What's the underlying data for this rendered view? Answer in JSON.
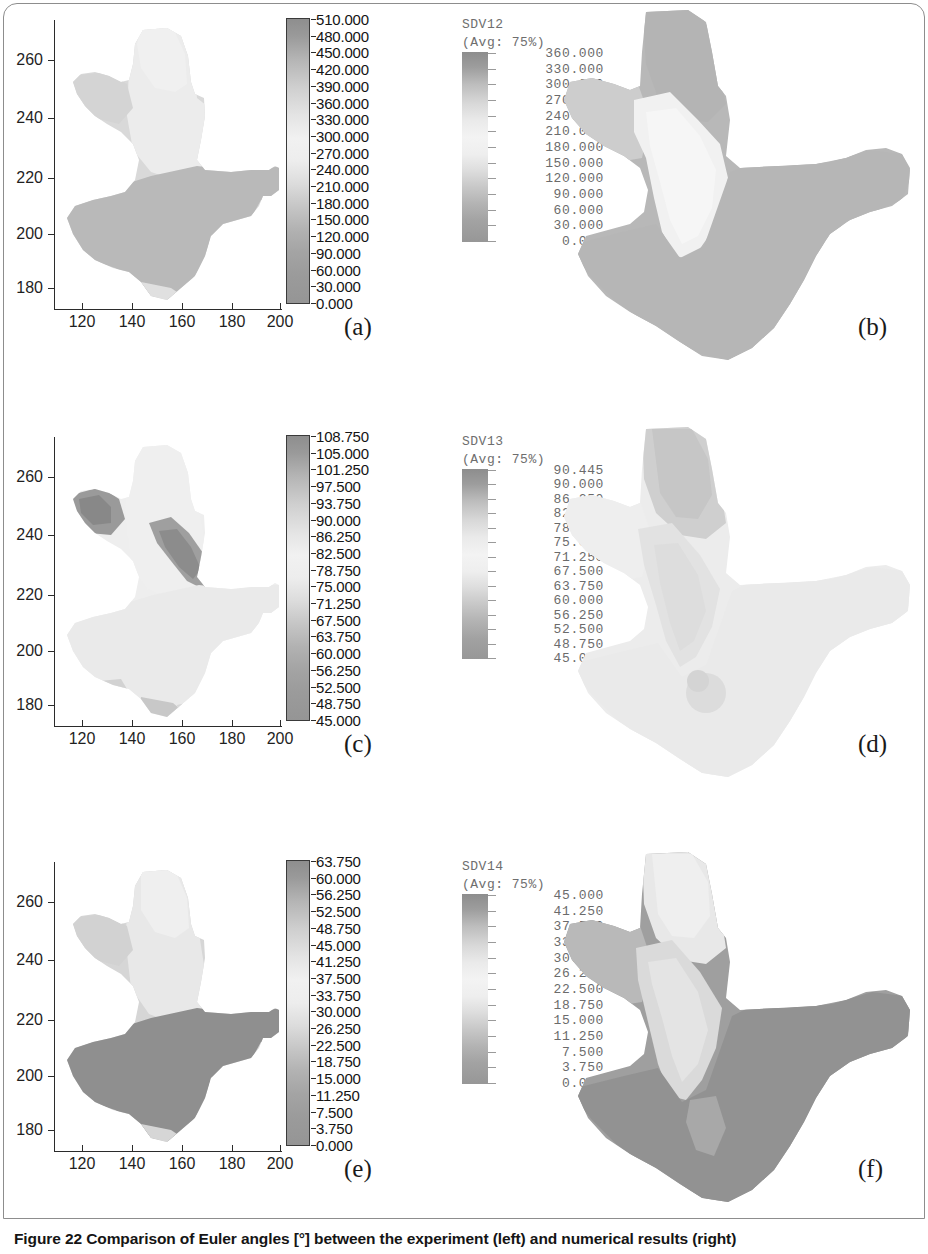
{
  "figure": {
    "caption": "Figure 22 Comparison of Euler angles [°] between the experiment (left) and numerical results (right)",
    "caption_label": "Figure 22",
    "left_column_title": "experiment",
    "right_column_title": "numerical results"
  },
  "axes": {
    "x_ticks": [
      "120",
      "140",
      "160",
      "180",
      "200"
    ],
    "y_ticks": [
      "180",
      "200",
      "220",
      "240",
      "260"
    ],
    "x_range": [
      110,
      203
    ],
    "y_range": [
      171,
      268
    ]
  },
  "panels": [
    {
      "letter": "(a)",
      "kind": "experiment",
      "colorbar": {
        "labels": [
          "510.000",
          "480.000",
          "450.000",
          "420.000",
          "390.000",
          "360.000",
          "330.000",
          "300.000",
          "270.000",
          "240.000",
          "210.000",
          "180.000",
          "150.000",
          "120.000",
          "90.000",
          "60.000",
          "30.000",
          "0.000"
        ],
        "max": 510.0,
        "min": 0.0,
        "step": 30.0
      }
    },
    {
      "letter": "(b)",
      "kind": "numerical",
      "legend_var": "SDV12",
      "legend_avg": "(Avg: 75%)",
      "colorbar": {
        "labels": [
          "360.000",
          "330.000",
          "300.000",
          "270.000",
          "240.000",
          "210.000",
          "180.000",
          "150.000",
          "120.000",
          "90.000",
          "60.000",
          "30.000",
          "0.000"
        ],
        "max": 360.0,
        "min": 0.0,
        "step": 30.0
      }
    },
    {
      "letter": "(c)",
      "kind": "experiment",
      "colorbar": {
        "labels": [
          "108.750",
          "105.000",
          "101.250",
          "97.500",
          "93.750",
          "90.000",
          "86.250",
          "82.500",
          "78.750",
          "75.000",
          "71.250",
          "67.500",
          "63.750",
          "60.000",
          "56.250",
          "52.500",
          "48.750",
          "45.000"
        ],
        "max": 108.75,
        "min": 45.0,
        "step": 3.75
      }
    },
    {
      "letter": "(d)",
      "kind": "numerical",
      "legend_var": "SDV13",
      "legend_avg": "(Avg: 75%)",
      "colorbar": {
        "labels": [
          "90.445",
          "90.000",
          "86.250",
          "82.500",
          "78.750",
          "75.000",
          "71.250",
          "67.500",
          "63.750",
          "60.000",
          "56.250",
          "52.500",
          "48.750",
          "45.000"
        ],
        "max": 90.445,
        "min": 45.0,
        "step": 3.75
      }
    },
    {
      "letter": "(e)",
      "kind": "experiment",
      "colorbar": {
        "labels": [
          "63.750",
          "60.000",
          "56.250",
          "52.500",
          "48.750",
          "45.000",
          "41.250",
          "37.500",
          "33.750",
          "30.000",
          "26.250",
          "22.500",
          "18.750",
          "15.000",
          "11.250",
          "7.500",
          "3.750",
          "0.000"
        ],
        "max": 63.75,
        "min": 0.0,
        "step": 3.75
      }
    },
    {
      "letter": "(f)",
      "kind": "numerical",
      "legend_var": "SDV14",
      "legend_avg": "(Avg: 75%)",
      "colorbar": {
        "labels": [
          "45.000",
          "41.250",
          "37.500",
          "33.750",
          "30.000",
          "26.250",
          "22.500",
          "18.750",
          "15.000",
          "11.250",
          "7.500",
          "3.750",
          "0.000"
        ],
        "max": 45.0,
        "min": 0.0,
        "step": 3.75
      }
    }
  ],
  "chart_data": {
    "type": "heatmap",
    "title": "Comparison of Euler angles [°] between the experiment (left) and numerical results (right)",
    "xlabel": "",
    "ylabel": "",
    "grid": false,
    "legend_position": "right-of-axes",
    "subplots": [
      {
        "label": "(a)",
        "side": "left",
        "source": "experiment",
        "quantity": "Euler angle phi1 [deg]",
        "xlim": [
          110,
          203
        ],
        "ylim": [
          171,
          268
        ],
        "xticks": [
          120,
          140,
          160,
          180,
          200
        ],
        "yticks": [
          180,
          200,
          220,
          240,
          260
        ],
        "colorbar_ticks": [
          510.0,
          480.0,
          450.0,
          420.0,
          390.0,
          360.0,
          330.0,
          300.0,
          270.0,
          240.0,
          210.0,
          180.0,
          150.0,
          120.0,
          90.0,
          60.0,
          30.0,
          0.0
        ],
        "colorbar_range": [
          0.0,
          510.0
        ],
        "regions": [
          {
            "name": "upper-north lobe",
            "approx_value": 270,
            "tone": "very-light"
          },
          {
            "name": "upper-central column",
            "approx_value": 255,
            "tone": "light"
          },
          {
            "name": "north-west arm",
            "approx_value": 150,
            "tone": "mid-light"
          },
          {
            "name": "lower body + east arm",
            "approx_value": 120,
            "tone": "mid-gray"
          },
          {
            "name": "south tail sliver",
            "approx_value": 240,
            "tone": "light"
          }
        ]
      },
      {
        "label": "(b)",
        "side": "right",
        "source": "numerical",
        "quantity": "SDV12",
        "avg": "75%",
        "colorbar_ticks": [
          360.0,
          330.0,
          300.0,
          270.0,
          240.0,
          210.0,
          180.0,
          150.0,
          120.0,
          90.0,
          60.0,
          30.0,
          0.0
        ],
        "colorbar_range": [
          0.0,
          360.0
        ],
        "regions": [
          {
            "name": "north lobe",
            "approx_value": 120,
            "tone": "mid-gray"
          },
          {
            "name": "central vertical band",
            "approx_value": 300,
            "tone": "very-light"
          },
          {
            "name": "north-west arm",
            "approx_value": 210,
            "tone": "light"
          },
          {
            "name": "lower body + east arm",
            "approx_value": 135,
            "tone": "mid-gray"
          }
        ]
      },
      {
        "label": "(c)",
        "side": "left",
        "source": "experiment",
        "quantity": "Euler angle Phi [deg]",
        "xlim": [
          110,
          203
        ],
        "ylim": [
          171,
          268
        ],
        "xticks": [
          120,
          140,
          160,
          180,
          200
        ],
        "yticks": [
          180,
          200,
          220,
          240,
          260
        ],
        "colorbar_ticks": [
          108.75,
          105.0,
          101.25,
          97.5,
          93.75,
          90.0,
          86.25,
          82.5,
          78.75,
          75.0,
          71.25,
          67.5,
          63.75,
          60.0,
          56.25,
          52.5,
          48.75,
          45.0
        ],
        "colorbar_range": [
          45.0,
          108.75
        ],
        "regions": [
          {
            "name": "bulk of specimen",
            "approx_value": 105,
            "tone": "very-light"
          },
          {
            "name": "north-west dark patch",
            "approx_value": 60,
            "tone": "dark"
          },
          {
            "name": "central dark streak",
            "approx_value": 62,
            "tone": "dark"
          },
          {
            "name": "south tail speckles",
            "approx_value": 72,
            "tone": "mid-gray"
          }
        ]
      },
      {
        "label": "(d)",
        "side": "right",
        "source": "numerical",
        "quantity": "SDV13",
        "avg": "75%",
        "colorbar_ticks": [
          90.445,
          90.0,
          86.25,
          82.5,
          78.75,
          75.0,
          71.25,
          67.5,
          63.75,
          60.0,
          56.25,
          52.5,
          48.75,
          45.0
        ],
        "colorbar_range": [
          45.0,
          90.445
        ],
        "regions": [
          {
            "name": "bulk of specimen",
            "approx_value": 88,
            "tone": "very-light"
          },
          {
            "name": "north lobe patch",
            "approx_value": 68,
            "tone": "mid-gray"
          },
          {
            "name": "central neck streak",
            "approx_value": 75,
            "tone": "light-mid"
          }
        ]
      },
      {
        "label": "(e)",
        "side": "left",
        "source": "experiment",
        "quantity": "Euler angle phi2 [deg]",
        "xlim": [
          110,
          203
        ],
        "ylim": [
          171,
          268
        ],
        "xticks": [
          120,
          140,
          160,
          180,
          200
        ],
        "yticks": [
          180,
          200,
          220,
          240,
          260
        ],
        "colorbar_ticks": [
          63.75,
          60.0,
          56.25,
          52.5,
          48.75,
          45.0,
          41.25,
          37.5,
          33.75,
          30.0,
          26.25,
          22.5,
          18.75,
          15.0,
          11.25,
          7.5,
          3.75,
          0.0
        ],
        "colorbar_range": [
          0.0,
          63.75
        ],
        "regions": [
          {
            "name": "upper lobe",
            "approx_value": 56,
            "tone": "very-light"
          },
          {
            "name": "upper-central column",
            "approx_value": 50,
            "tone": "light"
          },
          {
            "name": "north-west arm",
            "approx_value": 45,
            "tone": "mid-light"
          },
          {
            "name": "lower body + east arm",
            "approx_value": 18,
            "tone": "dark-gray"
          }
        ]
      },
      {
        "label": "(f)",
        "side": "right",
        "source": "numerical",
        "quantity": "SDV14",
        "avg": "75%",
        "colorbar_ticks": [
          45.0,
          41.25,
          37.5,
          33.75,
          30.0,
          26.25,
          22.5,
          18.75,
          15.0,
          11.25,
          7.5,
          3.75,
          0.0
        ],
        "colorbar_range": [
          0.0,
          45.0
        ],
        "regions": [
          {
            "name": "north lobe",
            "approx_value": 41,
            "tone": "very-light"
          },
          {
            "name": "central vertical band",
            "approx_value": 37,
            "tone": "light"
          },
          {
            "name": "north-west arm",
            "approx_value": 26,
            "tone": "mid-gray"
          },
          {
            "name": "lower body + east arm",
            "approx_value": 15,
            "tone": "dark-gray"
          }
        ]
      }
    ]
  }
}
